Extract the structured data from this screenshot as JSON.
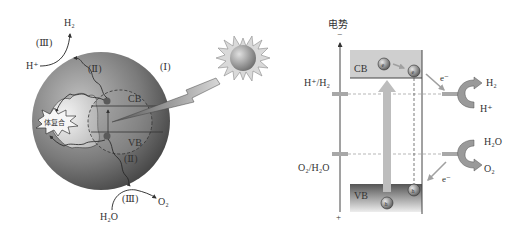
{
  "left_panel": {
    "stage_labels": {
      "absorption": "(Ⅰ)",
      "transfer_top": "(Ⅱ)",
      "transfer_bottom": "(Ⅱ)",
      "reaction_top": "(Ⅲ)",
      "reaction_bottom": "(Ⅲ)"
    },
    "band_labels": {
      "cb": "CB",
      "vb": "VB"
    },
    "recombination_label": "体复合",
    "reduction": {
      "reactant": "H⁺",
      "product": "H₂"
    },
    "oxidation": {
      "reactant": "H₂O",
      "product": "O₂"
    }
  },
  "right_panel": {
    "axis_title": "电势",
    "axis_top_sign": "−",
    "axis_bottom_sign": "+",
    "levels": [
      {
        "label": "H⁺/H₂"
      },
      {
        "label": "O₂/H₂O"
      }
    ],
    "band_labels": {
      "cb": "CB",
      "vb": "VB"
    },
    "electron_symbol": "e",
    "hole_symbol": "h",
    "electron_arrow_label": "e⁻",
    "hole_arrow_label": "e⁻",
    "reduction": {
      "reactant": "H⁺",
      "product": "H₂"
    },
    "oxidation": {
      "reactant": "H₂O",
      "product": "O₂"
    }
  },
  "colors": {
    "sphere_dark": "#4a4a4a",
    "sphere_light": "#f2f2f2",
    "band_cb": "#c8c8c8",
    "band_vb_dark": "#5a5a5a",
    "arrow_gray": "#b8b8b8",
    "text": "#333333"
  }
}
